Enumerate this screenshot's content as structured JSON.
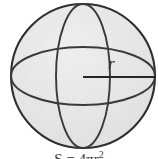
{
  "figure": {
    "name": "sphere-with-radius",
    "type": "geometry-diagram",
    "shape": "sphere",
    "radius_label": "r",
    "formula_text": "S = 4πr",
    "formula_exponent": "2",
    "formula_note": "cropped at bottom edge of image",
    "colors": {
      "background": "#ffffff",
      "sphere_fill": "#e8e8e8",
      "sphere_fill_light": "#f1f1f1",
      "outline": "#2f2f2f",
      "ellipse_stroke": "#3a3a3a",
      "radius_stroke": "#262626",
      "label_text": "#2b2b2b",
      "caption_text": "#3a3a3a"
    },
    "geometry": {
      "center_x": 83,
      "center_y": 76,
      "circle_radius": 72,
      "equator_ry": 29,
      "meridian_rx": 27,
      "radius_line_x1": 83,
      "radius_line_y1": 77,
      "radius_line_x2": 156,
      "radius_line_y2": 77
    }
  }
}
